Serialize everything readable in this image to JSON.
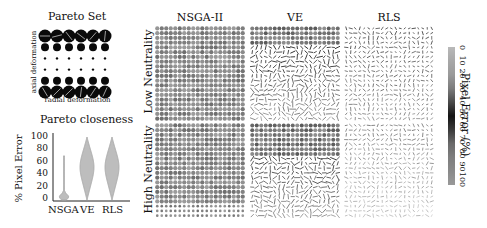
{
  "pareto_set": {
    "title": "Pareto Set",
    "ylabel": "axial deformation",
    "xlabel": "radial deformation",
    "rows": 6,
    "cols": 6,
    "row_dot_sizes": [
      6.5,
      4,
      1.2,
      1.2,
      4,
      6.5
    ],
    "row_has_line": [
      true,
      false,
      false,
      false,
      false,
      true
    ]
  },
  "pareto_closeness": {
    "title": "Pareto closeness",
    "ylabel": "% Pixel Error"
  },
  "grid_panels": {
    "columns": [
      "NSGA-II",
      "VE",
      "RLS"
    ],
    "rows": [
      "Low Neutrality",
      "High Neutrality"
    ],
    "grid_size": 20
  },
  "colorbar": {
    "label": "Pixel Error (%)",
    "ticks": [
      "0",
      "10",
      "20",
      "30",
      "40",
      "50",
      "60",
      "70",
      "80",
      "90",
      "100"
    ],
    "colors": [
      "#b9b9b9",
      "#a8a8a8",
      "#9a9a9a",
      "#7c7c7c",
      "#4a4a4a",
      "#141414",
      "#3a3a3a",
      "#6a6a6a",
      "#7e7e7e",
      "#8a8a8a",
      "#999999"
    ]
  },
  "chart_data": [
    {
      "type": "scatter",
      "title": "Pareto Set",
      "xlabel": "radial deformation",
      "ylabel": "axial deformation",
      "grid": "6x6 circle glyphs",
      "marker_size_by_row": [
        6.5,
        4,
        1.2,
        1.2,
        4,
        6.5
      ]
    },
    {
      "type": "violin",
      "title": "Pareto closeness",
      "categories": [
        "NSGA",
        "VE",
        "RLS"
      ],
      "ylabel": "% Pixel Error",
      "ylim": [
        0,
        100
      ],
      "yticks": [
        0,
        20,
        40,
        60,
        80,
        100
      ],
      "series": [
        {
          "name": "NSGA",
          "min": 0,
          "max": 70,
          "mode": 5,
          "max_halfwidth": 4
        },
        {
          "name": "VE",
          "min": 0,
          "max": 100,
          "mode": 55,
          "max_halfwidth": 7
        },
        {
          "name": "RLS",
          "min": 0,
          "max": 100,
          "mode": 55,
          "max_halfwidth": 7
        }
      ]
    },
    {
      "type": "heatmap",
      "title": "Pixel error maps",
      "columns": [
        "NSGA-II",
        "VE",
        "RLS"
      ],
      "rows": [
        "Low Neutrality",
        "High Neutrality"
      ],
      "colorbar_label": "Pixel Error (%)",
      "colorbar_range": [
        0,
        100
      ],
      "panel_mean_error_estimate": {
        "NSGA-II": {
          "Low Neutrality": 5,
          "High Neutrality": 8
        },
        "VE": {
          "Low Neutrality": 45,
          "High Neutrality": 40
        },
        "RLS": {
          "Low Neutrality": 75,
          "High Neutrality": 85
        }
      }
    }
  ],
  "violin_labels": [
    "NSGA",
    "VE",
    "RLS"
  ],
  "violin_yticks": [
    "100",
    "80",
    "60",
    "40",
    "20",
    "0"
  ]
}
